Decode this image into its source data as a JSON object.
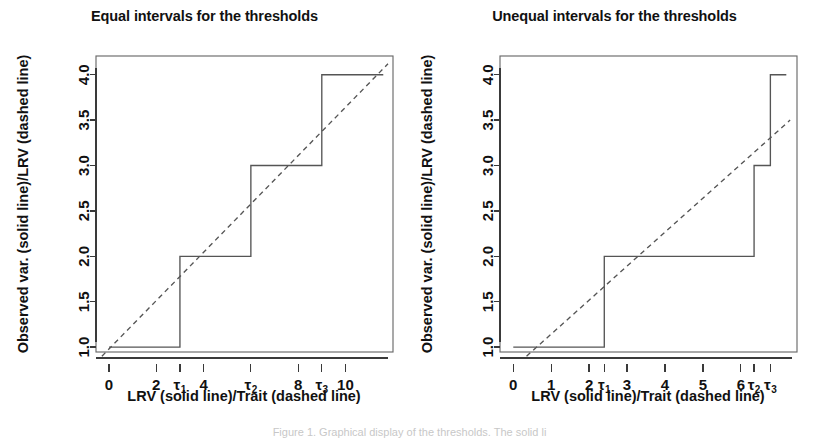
{
  "figure": {
    "background": "#ffffff",
    "line_color": "#555555",
    "text_color": "#111111"
  },
  "caption": "Figure 1. Graphical display of the thresholds. The solid li",
  "panels": [
    {
      "id": "equal",
      "title": "Equal intervals for the thresholds",
      "xlabel": "LRV (solid line)/Trait (dashed line)",
      "ylabel": "Observed var. (solid line)/LRV (dashed line)",
      "xticks": [
        {
          "value": 0,
          "label": "0",
          "sub": ""
        },
        {
          "value": 2,
          "label": "2",
          "sub": ""
        },
        {
          "value": 3,
          "label": "τ",
          "sub": "1"
        },
        {
          "value": 4,
          "label": "4",
          "sub": ""
        },
        {
          "value": 6,
          "label": "τ",
          "sub": "2"
        },
        {
          "value": 8,
          "label": "8",
          "sub": ""
        },
        {
          "value": 9,
          "label": "τ",
          "sub": "3"
        },
        {
          "value": 10,
          "label": "10",
          "sub": ""
        }
      ],
      "yticks": [
        {
          "value": 1.0,
          "label": "1.0"
        },
        {
          "value": 1.5,
          "label": "1.5"
        },
        {
          "value": 2.0,
          "label": "2.0"
        },
        {
          "value": 2.5,
          "label": "2.5"
        },
        {
          "value": 3.0,
          "label": "3.0"
        },
        {
          "value": 3.5,
          "label": "3.5"
        },
        {
          "value": 4.0,
          "label": "4.0"
        }
      ]
    },
    {
      "id": "unequal",
      "title": "Unequal intervals for the thresholds",
      "xlabel": "LRV (solid line)/Trait (dashed line)",
      "ylabel": "Observed var. (solid line)/LRV (dashed line)",
      "xticks": [
        {
          "value": 0,
          "label": "0",
          "sub": ""
        },
        {
          "value": 1,
          "label": "1",
          "sub": ""
        },
        {
          "value": 2,
          "label": "2",
          "sub": ""
        },
        {
          "value": 2.4,
          "label": "τ",
          "sub": "1"
        },
        {
          "value": 3,
          "label": "3",
          "sub": ""
        },
        {
          "value": 4,
          "label": "4",
          "sub": ""
        },
        {
          "value": 5,
          "label": "5",
          "sub": ""
        },
        {
          "value": 6,
          "label": "6",
          "sub": ""
        },
        {
          "value": 6.35,
          "label": "τ",
          "sub": "2"
        },
        {
          "value": 6.78,
          "label": "τ",
          "sub": "3"
        }
      ],
      "yticks": [
        {
          "value": 1.0,
          "label": "1.0"
        },
        {
          "value": 1.5,
          "label": "1.5"
        },
        {
          "value": 2.0,
          "label": "2.0"
        },
        {
          "value": 2.5,
          "label": "2.5"
        },
        {
          "value": 3.0,
          "label": "3.0"
        },
        {
          "value": 3.5,
          "label": "3.5"
        },
        {
          "value": 4.0,
          "label": "4.0"
        }
      ]
    }
  ],
  "chart_data": [
    {
      "type": "line",
      "id": "equal",
      "title": "Equal intervals for the thresholds",
      "xlabel": "LRV (solid line)/Trait (dashed line)",
      "ylabel": "Observed var. (solid line)/LRV (dashed line)",
      "xlim": [
        -0.55,
        11.8
      ],
      "ylim": [
        0.88,
        4.14
      ],
      "grid": false,
      "legend": "none",
      "thresholds": [
        3,
        6,
        9
      ],
      "thresholds_labels": [
        "τ₁",
        "τ₂",
        "τ₃"
      ],
      "series": [
        {
          "name": "Observed var. (solid line)",
          "style": "solid-step",
          "x": [
            0,
            3,
            3,
            6,
            6,
            9,
            9,
            11.6
          ],
          "y": [
            1,
            1,
            2,
            2,
            3,
            3,
            4,
            4
          ]
        },
        {
          "name": "LRV (dashed line)",
          "style": "dashed",
          "x": [
            -0.3,
            11.8
          ],
          "y": [
            0.9,
            4.12
          ]
        }
      ]
    },
    {
      "type": "line",
      "id": "unequal",
      "title": "Unequal intervals for the thresholds",
      "xlabel": "LRV (solid line)/Trait (dashed line)",
      "ylabel": "Observed var. (solid line)/LRV (dashed line)",
      "xlim": [
        -0.35,
        7.35
      ],
      "ylim": [
        0.88,
        4.14
      ],
      "grid": false,
      "legend": "none",
      "thresholds": [
        2.4,
        6.35,
        6.78
      ],
      "thresholds_labels": [
        "τ₁",
        "τ₂",
        "τ₃"
      ],
      "series": [
        {
          "name": "Observed var. (solid line)",
          "style": "solid-step",
          "x": [
            0,
            2.4,
            2.4,
            6.35,
            6.35,
            6.78,
            6.78,
            7.2
          ],
          "y": [
            1,
            1,
            2,
            2,
            3,
            3,
            4,
            4
          ]
        },
        {
          "name": "LRV (dashed line)",
          "style": "dashed",
          "x": [
            0.35,
            7.3
          ],
          "y": [
            0.9,
            3.5
          ]
        }
      ]
    }
  ]
}
